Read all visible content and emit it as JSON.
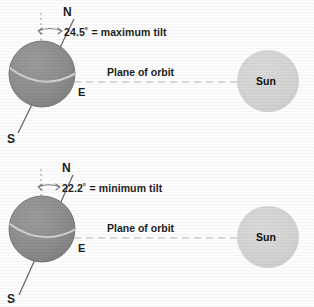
{
  "figure": {
    "colors": {
      "earth_fill": "#8d8d8d",
      "earth_stroke": "#6f6f6f",
      "sun_fill": "#d2d2d2",
      "equator_stroke": "#cfcfcf",
      "axis_stroke": "#6a6a6a",
      "dash_stroke": "#b9b9b9",
      "text": "#1d1d1d",
      "background": "#fdfdfd"
    }
  },
  "diagrams": [
    {
      "id": "maximum-tilt",
      "north_label": "N",
      "south_label": "S",
      "equator_label": "E",
      "tilt_label": "24.5˚ = maximum tilt",
      "tilt_value": "24.5",
      "tilt_unit": "˚",
      "tilt_description": "maximum tilt",
      "plane_label": "Plane of orbit",
      "sun_label": "Sun"
    },
    {
      "id": "minimum-tilt",
      "north_label": "N",
      "south_label": "S",
      "equator_label": "E",
      "tilt_label": "22.2˚ = minimum tilt",
      "tilt_value": "22.2",
      "tilt_unit": "˚",
      "tilt_description": "minimum tilt",
      "plane_label": "Plane of orbit",
      "sun_label": "Sun"
    }
  ]
}
